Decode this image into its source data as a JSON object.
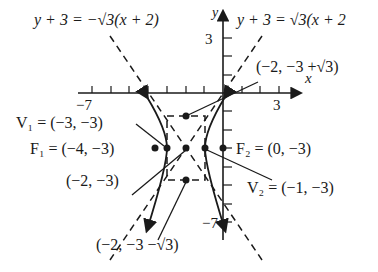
{
  "figure": {
    "type": "hyperbola-graph",
    "axes": {
      "x_label": "x",
      "y_label": "y",
      "x_tick_min_label": "−7",
      "x_tick_max_label": "3",
      "y_tick_max_label": "3",
      "y_tick_min_label": "−7"
    },
    "asymptotes": {
      "negative_slope": "y + 3 = −√3(x + 2)",
      "positive_slope": "y + 3 = √3(x + 2"
    },
    "points": {
      "v1": "V₁ = (−3, −3)",
      "f1": "F₁ = (−4, −3)",
      "center": "(−2, −3)",
      "f2": "F₂ = (0, −3)",
      "v2": "V₂ = (−1, −3)",
      "top": "(−2, −3 +√3)",
      "bottom": "(−2, −3 −√3)"
    },
    "colors": {
      "ink": "#1a1a1a",
      "background": "#ffffff"
    }
  }
}
